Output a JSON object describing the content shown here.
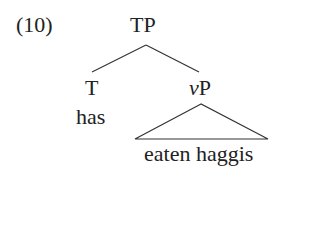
{
  "example_number": "(10)",
  "tree": {
    "root": {
      "label": "TP"
    },
    "left": {
      "label": "T",
      "terminal": "has"
    },
    "right": {
      "label_italic": "v",
      "label_rest": "P",
      "terminal_triangle": "eaten haggis"
    }
  }
}
